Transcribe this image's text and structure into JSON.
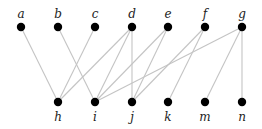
{
  "diagram": {
    "type": "bipartite-graph",
    "top_nodes": [
      {
        "id": "a",
        "label": "a",
        "x": 21,
        "y": 27
      },
      {
        "id": "b",
        "label": "b",
        "x": 58,
        "y": 27
      },
      {
        "id": "c",
        "label": "c",
        "x": 95,
        "y": 27
      },
      {
        "id": "d",
        "label": "d",
        "x": 132,
        "y": 27
      },
      {
        "id": "e",
        "label": "e",
        "x": 168,
        "y": 27
      },
      {
        "id": "f",
        "label": "f",
        "x": 205,
        "y": 27
      },
      {
        "id": "g",
        "label": "g",
        "x": 242,
        "y": 27
      }
    ],
    "bottom_nodes": [
      {
        "id": "h",
        "label": "h",
        "x": 58,
        "y": 102
      },
      {
        "id": "i",
        "label": "i",
        "x": 95,
        "y": 102
      },
      {
        "id": "j",
        "label": "j",
        "x": 132,
        "y": 102
      },
      {
        "id": "k",
        "label": "k",
        "x": 168,
        "y": 102
      },
      {
        "id": "m",
        "label": "m",
        "x": 205,
        "y": 102
      },
      {
        "id": "n",
        "label": "n",
        "x": 242,
        "y": 102
      }
    ],
    "edges": [
      [
        "a",
        "h"
      ],
      [
        "b",
        "i"
      ],
      [
        "c",
        "h"
      ],
      [
        "d",
        "h"
      ],
      [
        "d",
        "i"
      ],
      [
        "d",
        "j"
      ],
      [
        "e",
        "i"
      ],
      [
        "e",
        "j"
      ],
      [
        "f",
        "j"
      ],
      [
        "f",
        "k"
      ],
      [
        "g",
        "i"
      ],
      [
        "g",
        "m"
      ],
      [
        "g",
        "n"
      ]
    ],
    "colors": {
      "node": "#000000",
      "edge": "#c4c4c4",
      "label": "#222222"
    }
  }
}
